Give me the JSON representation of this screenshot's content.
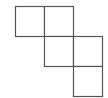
{
  "diagram": {
    "type": "polyomino-net",
    "stroke_color": "#555555",
    "fill_color": "#ffffff",
    "cell_size": 29,
    "origin": [
      15,
      6
    ],
    "cells": [
      {
        "col": 0,
        "row": 0
      },
      {
        "col": 1,
        "row": 0
      },
      {
        "col": 1,
        "row": 1
      },
      {
        "col": 2,
        "row": 1
      },
      {
        "col": 2,
        "row": 2
      }
    ]
  }
}
